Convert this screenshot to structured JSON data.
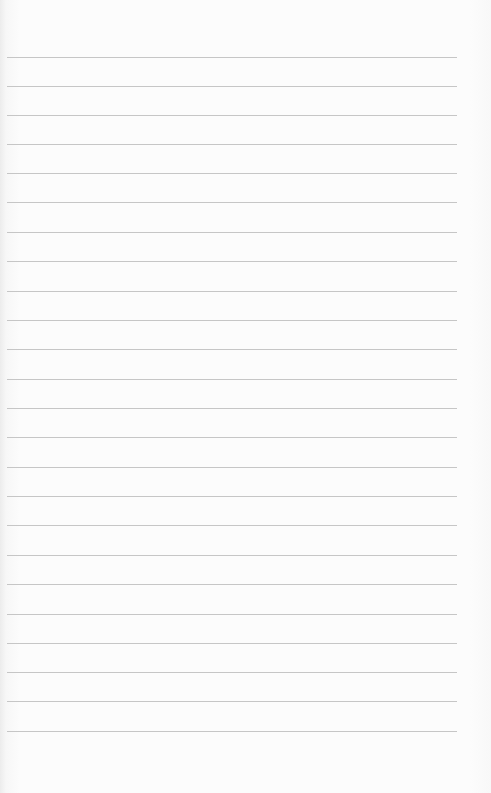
{
  "paper": {
    "background": "#fbfbfb",
    "line_color": "#c6c6c6",
    "line_count": 24,
    "lines_y": [
      57,
      86,
      115,
      144,
      173,
      202,
      232,
      261,
      291,
      320,
      349,
      379,
      408,
      437,
      467,
      496,
      525,
      555,
      584,
      614,
      643,
      672,
      701,
      731
    ]
  }
}
